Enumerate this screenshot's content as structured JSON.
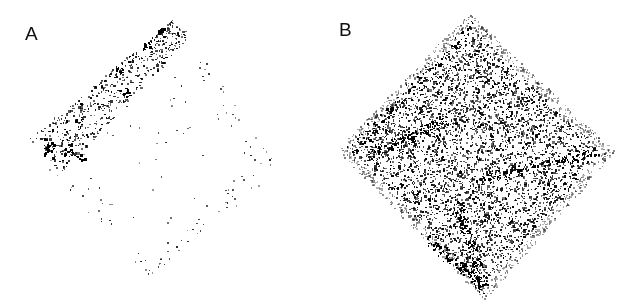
{
  "figure": {
    "panels": [
      {
        "label": "A",
        "description": "Sparse speckle pattern on diamond-shaped region; dense band along upper-left edge",
        "dot_color": "#000000",
        "diamond": {
          "cx": 150,
          "cy": 150,
          "top": [
            180,
            22
          ],
          "left": [
            28,
            150
          ],
          "bottom": [
            150,
            280
          ],
          "right": [
            278,
            168
          ]
        },
        "dense_band": {
          "from": [
            45,
            155
          ],
          "to": [
            180,
            28
          ],
          "width": 40,
          "count": 520
        },
        "sparse_count": 160,
        "seed": 7
      },
      {
        "label": "B",
        "description": "Dense speckle pattern filling diamond-shaped region",
        "dot_color": "#000000",
        "diamond": {
          "cx": 166,
          "cy": 152,
          "top": [
            160,
            20
          ],
          "left": [
            35,
            150
          ],
          "bottom": [
            175,
            292
          ],
          "right": [
            298,
            152
          ]
        },
        "count": 5200,
        "seed": 13
      }
    ]
  }
}
